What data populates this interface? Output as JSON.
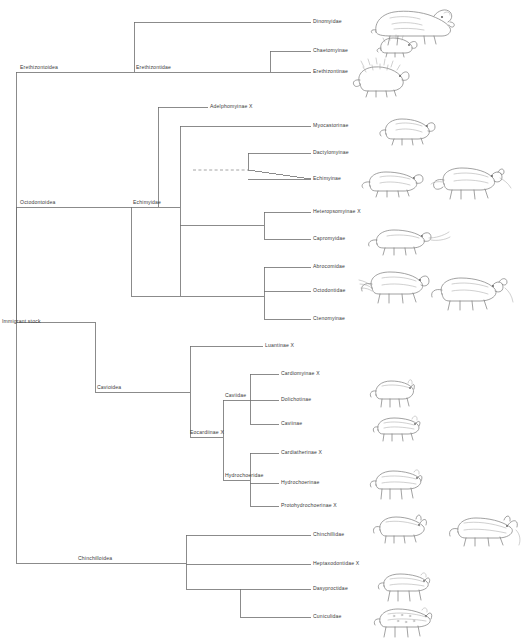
{
  "figure": {
    "type": "cladogram",
    "width": 527,
    "height": 641,
    "line_color": "#6e6e6e",
    "text_color": "#3a3a3a",
    "background": "#ffffff"
  },
  "root": {
    "label": "Immigrant stock",
    "x": 16,
    "y": 322
  },
  "superfamilies": [
    {
      "name": "erethizontoidea",
      "label": "Erethizontoidea",
      "x": 20,
      "y": 72
    },
    {
      "name": "octodontoidea",
      "label": "Octodontoidea",
      "x": 20,
      "y": 207
    },
    {
      "name": "cavioidea",
      "label": "Cavioidea",
      "x": 95,
      "y": 392
    },
    {
      "name": "chinchilloidea",
      "label": "Chinchilloidea",
      "x": 78,
      "y": 560
    }
  ],
  "families": [
    {
      "name": "erethizontidae",
      "label": "Erethizontidae",
      "x": 134,
      "y": 72
    },
    {
      "name": "echimyidae",
      "label": "Echimyidae",
      "x": 131,
      "y": 207
    },
    {
      "name": "caviidae",
      "label": "Caviidae",
      "x": 222,
      "y": 400
    },
    {
      "name": "hydrochoeridae",
      "label": "Hydrochoeridae",
      "x": 226,
      "y": 480
    },
    {
      "name": "eocardiinae",
      "label": "Eocardiinae  X",
      "x": 186,
      "y": 437
    }
  ],
  "tips": [
    {
      "name": "adelphomyinae",
      "label": "Adelphomyinae X",
      "x": 210,
      "y": 107,
      "extinct": true
    },
    {
      "name": "dinomyidae",
      "label": "Dinomyidae",
      "x": 313,
      "y": 22,
      "extinct": false
    },
    {
      "name": "chaetomyinae",
      "label": "Chaetomyinae",
      "x": 313,
      "y": 51,
      "extinct": false
    },
    {
      "name": "erethizontinae",
      "label": "Erethizontinae",
      "x": 313,
      "y": 75,
      "extinct": false
    },
    {
      "name": "myocastorinae",
      "label": "Myocastorinae",
      "x": 313,
      "y": 126,
      "extinct": false
    },
    {
      "name": "dactylomyinae",
      "label": "Dactylomyinae",
      "x": 313,
      "y": 153,
      "extinct": false
    },
    {
      "name": "echimyinae",
      "label": "Echimyinae",
      "x": 313,
      "y": 179,
      "extinct": false
    },
    {
      "name": "heteropsomyinae",
      "label": "Heteropsomyinae X",
      "x": 313,
      "y": 212,
      "extinct": true
    },
    {
      "name": "capromyidae",
      "label": "Capromyidae",
      "x": 313,
      "y": 239,
      "extinct": false
    },
    {
      "name": "abrocomidae",
      "label": "Abrocomidae",
      "x": 313,
      "y": 267,
      "extinct": false
    },
    {
      "name": "octodontidae",
      "label": "Octodontidae",
      "x": 313,
      "y": 291,
      "extinct": false
    },
    {
      "name": "ctenomyinae",
      "label": "Ctenomyinae",
      "x": 313,
      "y": 319,
      "extinct": false
    },
    {
      "name": "luantinae",
      "label": "Luantinae X",
      "x": 265,
      "y": 346,
      "extinct": true
    },
    {
      "name": "cardiomyinae",
      "label": "Cardiomyinae  X",
      "x": 281,
      "y": 374,
      "extinct": true
    },
    {
      "name": "dolichotinae",
      "label": "Dolichotinae",
      "x": 281,
      "y": 401,
      "extinct": false
    },
    {
      "name": "caviinae",
      "label": "Caviinae",
      "x": 281,
      "y": 424,
      "extinct": false
    },
    {
      "name": "cardiatherinae",
      "label": "Cardiatherinae X",
      "x": 281,
      "y": 453,
      "extinct": true
    },
    {
      "name": "hydrochoerinae",
      "label": "Hydrochoerinae",
      "x": 281,
      "y": 483,
      "extinct": false
    },
    {
      "name": "protohydrochoerinae",
      "label": "Protohydrochoerinae X",
      "x": 281,
      "y": 506,
      "extinct": true
    },
    {
      "name": "chinchillidae",
      "label": "Chinchillidae",
      "x": 313,
      "y": 535,
      "extinct": false
    },
    {
      "name": "heptaxodontidae",
      "label": "Heptaxodontidae X",
      "x": 313,
      "y": 564,
      "extinct": true
    },
    {
      "name": "dasyproctidae",
      "label": "Dasyproctidae",
      "x": 313,
      "y": 589,
      "extinct": false
    },
    {
      "name": "cuniculidae",
      "label": "Cuniculidae",
      "x": 313,
      "y": 617,
      "extinct": false
    }
  ],
  "illustrations": [
    {
      "name": "dinomys-illustration",
      "for": "dinomyidae",
      "x": 370,
      "y": 2
    },
    {
      "name": "chaetomys-illustration",
      "for": "chaetomyinae",
      "x": 375,
      "y": 32
    },
    {
      "name": "erethizon-illustration",
      "for": "erethizontinae",
      "x": 350,
      "y": 58
    },
    {
      "name": "myocastor-illustration",
      "for": "myocastorinae",
      "x": 378,
      "y": 112
    },
    {
      "name": "echimys-illustration",
      "for": "echimyinae",
      "x": 360,
      "y": 166
    },
    {
      "name": "rat-illustration",
      "for": "echimyinae",
      "x": 430,
      "y": 162
    },
    {
      "name": "capromys-illustration",
      "for": "capromyidae",
      "x": 365,
      "y": 222
    },
    {
      "name": "octodon-illustration",
      "for": "octodontidae",
      "x": 358,
      "y": 262
    },
    {
      "name": "ctenomys-illustration",
      "for": "octodontidae",
      "x": 430,
      "y": 270
    },
    {
      "name": "cavy-illustration",
      "for": "dolichotinae",
      "x": 368,
      "y": 375
    },
    {
      "name": "guineapig-illustration",
      "for": "caviinae",
      "x": 372,
      "y": 412
    },
    {
      "name": "capybara-illustration",
      "for": "hydrochoerinae",
      "x": 368,
      "y": 465
    },
    {
      "name": "chinchilla-illustration",
      "for": "chinchillidae",
      "x": 372,
      "y": 512
    },
    {
      "name": "viscacha-illustration",
      "for": "chinchillidae",
      "x": 448,
      "y": 512
    },
    {
      "name": "agouti-illustration",
      "for": "dasyproctidae",
      "x": 376,
      "y": 568
    },
    {
      "name": "paca-illustration",
      "for": "cuniculidae",
      "x": 372,
      "y": 604
    }
  ]
}
